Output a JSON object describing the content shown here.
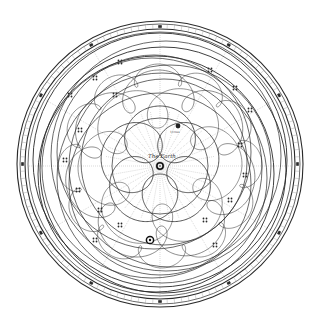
{
  "diagram": {
    "center_label": "The Earth",
    "sun_label": "Sun",
    "inner_body_label": "Venus",
    "colors": {
      "ink": "#2a2a2a",
      "light_ink": "#8a8a8a",
      "background": "#ffffff"
    },
    "geometry": {
      "center_x": 160,
      "center_y": 164,
      "outer_radius": 143
    },
    "zodiac_band": {
      "rings": 4,
      "symbols": [
        "aries-icon",
        "taurus-icon",
        "gemini-icon",
        "cancer-icon",
        "leo-icon",
        "virgo-icon",
        "libra-icon",
        "scorpio-icon",
        "sagittarius-icon",
        "capricorn-icon",
        "aquarius-icon",
        "pisces-icon"
      ]
    },
    "orbits": {
      "inner_rose_petals": 5,
      "mid_loops": 7,
      "outer_circles": 10
    }
  }
}
